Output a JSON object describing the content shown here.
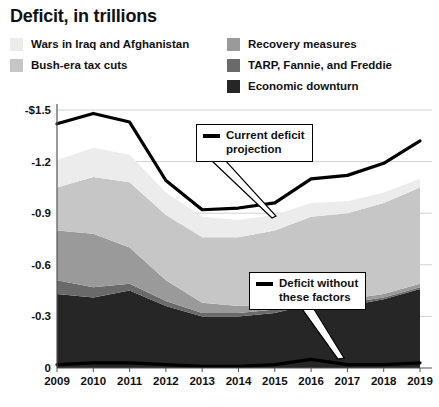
{
  "title": "Deficit, in trillions",
  "legend": {
    "left_column": [
      {
        "label": "Wars in Iraq and Afghanistan",
        "color": "#ececec",
        "key": "wars"
      },
      {
        "label": "Bush-era tax cuts",
        "color": "#c6c6c6",
        "key": "bush_tax_cuts"
      }
    ],
    "right_column": [
      {
        "label": "Recovery measures",
        "color": "#9a9a9a",
        "key": "recovery_measures"
      },
      {
        "label": "TARP, Fannie, and Freddie",
        "color": "#6a6a6a",
        "key": "tarp"
      },
      {
        "label": "Economic downturn",
        "color": "#262626",
        "key": "economic_downturn"
      }
    ]
  },
  "annotations": [
    {
      "name": "current-deficit-projection",
      "text": "Current deficit\nprojection",
      "swatch": "line-black",
      "points_to_year": 2016
    },
    {
      "name": "deficit-without-these-factors",
      "text": "Deficit without\nthese factors",
      "swatch": "line-black",
      "points_to_year": 2017
    }
  ],
  "axes": {
    "y_ticks": [
      "-$1.5",
      "-1.2",
      "-0.9",
      "-0.6",
      "-0.3",
      "0"
    ],
    "y_tick_values": [
      -1.5,
      -1.2,
      -0.9,
      -0.6,
      -0.3,
      0
    ],
    "x_ticks": [
      "2009",
      "2010",
      "2011",
      "2012",
      "2013",
      "2014",
      "2015",
      "2016",
      "2017",
      "2018",
      "2019"
    ]
  },
  "chart_data": {
    "type": "area",
    "title": "Deficit, in trillions",
    "xlabel": "",
    "ylabel": "Deficit, in trillions",
    "x": [
      2009,
      2010,
      2011,
      2012,
      2013,
      2014,
      2015,
      2016,
      2017,
      2018,
      2019
    ],
    "ylim": [
      -1.5,
      0
    ],
    "y_ticks": [
      -1.5,
      -1.2,
      -0.9,
      -0.6,
      -0.3,
      0
    ],
    "grid": true,
    "legend_position": "top",
    "stacked": true,
    "stack_order_bottom_to_top": [
      "Economic downturn",
      "TARP, Fannie, and Freddie",
      "Recovery measures",
      "Bush-era tax cuts",
      "Wars in Iraq and Afghanistan"
    ],
    "series": [
      {
        "name": "Economic downturn",
        "color": "#262626",
        "values": [
          -0.43,
          -0.41,
          -0.45,
          -0.36,
          -0.3,
          -0.3,
          -0.32,
          -0.37,
          -0.36,
          -0.4,
          -0.46
        ]
      },
      {
        "name": "TARP, Fannie, and Freddie",
        "color": "#6a6a6a",
        "values": [
          -0.08,
          -0.06,
          -0.04,
          -0.03,
          -0.02,
          -0.02,
          -0.02,
          -0.02,
          -0.02,
          -0.01,
          -0.01
        ]
      },
      {
        "name": "Recovery measures",
        "color": "#9a9a9a",
        "values": [
          -0.29,
          -0.31,
          -0.21,
          -0.12,
          -0.06,
          -0.04,
          -0.03,
          -0.02,
          -0.02,
          -0.02,
          -0.02
        ]
      },
      {
        "name": "Bush-era tax cuts",
        "color": "#c6c6c6",
        "values": [
          -0.25,
          -0.33,
          -0.38,
          -0.38,
          -0.38,
          -0.4,
          -0.43,
          -0.47,
          -0.5,
          -0.53,
          -0.56
        ]
      },
      {
        "name": "Wars in Iraq and Afghanistan",
        "color": "#ececec",
        "values": [
          -0.16,
          -0.17,
          -0.16,
          -0.13,
          -0.12,
          -0.1,
          -0.09,
          -0.08,
          -0.07,
          -0.06,
          -0.05
        ]
      }
    ],
    "lines": [
      {
        "name": "Current deficit projection",
        "color": "#000000",
        "values": [
          -1.42,
          -1.48,
          -1.43,
          -1.09,
          -0.92,
          -0.93,
          -0.96,
          -1.1,
          -1.12,
          -1.19,
          -1.32
        ]
      },
      {
        "name": "Deficit without these factors",
        "color": "#000000",
        "values": [
          -0.02,
          -0.03,
          -0.03,
          -0.02,
          -0.01,
          -0.01,
          -0.02,
          -0.05,
          -0.02,
          -0.02,
          -0.03
        ]
      }
    ]
  }
}
